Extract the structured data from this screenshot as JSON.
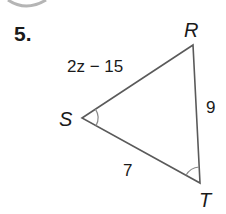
{
  "problem": {
    "number": "5."
  },
  "triangle": {
    "vertices": {
      "R": {
        "label": "R",
        "x": 193,
        "y": 45
      },
      "S": {
        "label": "S",
        "x": 82,
        "y": 118
      },
      "T": {
        "label": "T",
        "x": 200,
        "y": 183
      }
    },
    "sides": {
      "SR": {
        "label": "2z − 15"
      },
      "RT": {
        "label": "9"
      },
      "ST": {
        "label": "7"
      }
    },
    "congruent_angles": [
      "S",
      "T"
    ],
    "colors": {
      "stroke": "#5a5a5a",
      "arc": "#8a8a8a",
      "text": "#1a1a1a"
    }
  }
}
